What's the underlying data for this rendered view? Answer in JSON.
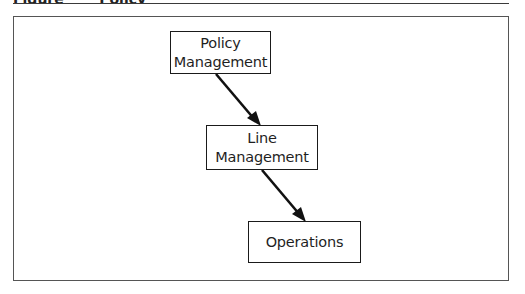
{
  "figure": {
    "caption_partial": "Figure · · · Policy · · · ·",
    "frame_color": "#555555",
    "line_color": "#1a1a1a"
  },
  "nodes": [
    {
      "id": "policy",
      "lines": [
        "Policy",
        "Management"
      ]
    },
    {
      "id": "line",
      "lines": [
        "Line",
        "Management"
      ]
    },
    {
      "id": "operations",
      "lines": [
        "Operations"
      ]
    }
  ],
  "edges": [
    {
      "from": "policy",
      "to": "line",
      "type": "arrow"
    },
    {
      "from": "line",
      "to": "operations",
      "type": "arrow"
    }
  ]
}
